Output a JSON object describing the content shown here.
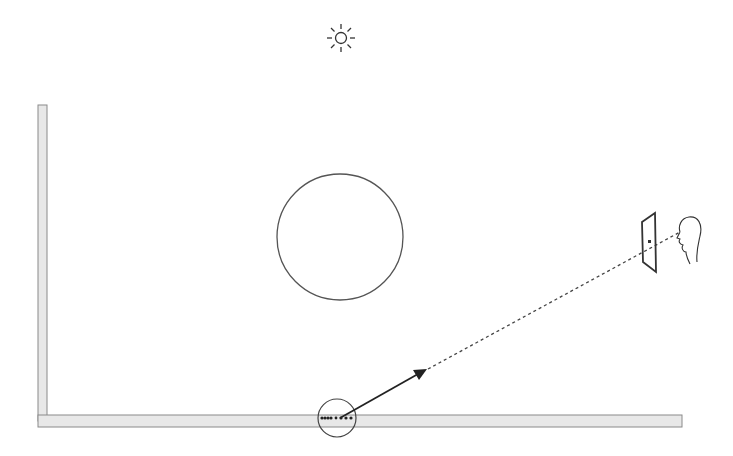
{
  "diagram": {
    "colors": {
      "background": "#ffffff",
      "stroke": "#333333",
      "surface_fill": "#e6e6e6",
      "surface_stroke": "#888888",
      "sphere_stroke": "#555555"
    },
    "elements": {
      "light_source": {
        "icon": "sun-icon",
        "cx": 341,
        "cy": 38
      },
      "sphere": {
        "cx": 340,
        "cy": 237,
        "r": 63
      },
      "wall": {
        "x": 38,
        "y": 105,
        "width": 9,
        "height": 316
      },
      "floor": {
        "x": 38,
        "y": 415,
        "width": 644,
        "height": 12
      },
      "sample_region": {
        "cx": 337,
        "cy": 418,
        "r": 19
      },
      "ray_arrow": {
        "x1": 340,
        "y1": 418,
        "x2": 426,
        "y2": 370
      },
      "view_ray": {
        "x1": 426,
        "y1": 370,
        "x2": 681,
        "y2": 232,
        "style": "dashed"
      },
      "image_plane": {
        "points": "642,222 655,212 656,272 643,262"
      },
      "viewer": {
        "icon": "viewer-head-icon",
        "x": 672,
        "y": 216
      }
    }
  }
}
